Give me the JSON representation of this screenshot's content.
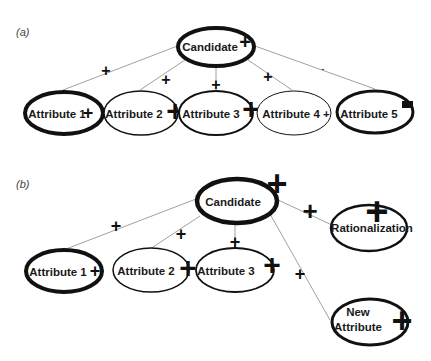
{
  "panels": [
    {
      "label": "(a)",
      "root": {
        "label": "Candidate",
        "sign": "+"
      },
      "children": [
        {
          "label": "Attribute 1",
          "node_sign": "+",
          "edge_sign": "+"
        },
        {
          "label": "Attribute 2",
          "node_sign": "+",
          "edge_sign": "+"
        },
        {
          "label": "Attribute 3",
          "node_sign": "+",
          "edge_sign": "+"
        },
        {
          "label": "Attribute 4 +",
          "node_sign": "",
          "edge_sign": "+"
        },
        {
          "label": "Attribute 5",
          "node_sign": "-",
          "edge_sign": "-"
        }
      ]
    },
    {
      "label": "(b)",
      "root": {
        "label": "Candidate",
        "sign": "+"
      },
      "children": [
        {
          "label": "Attribute 1",
          "node_sign": "+",
          "edge_sign": "+"
        },
        {
          "label": "Attribute 2",
          "node_sign": "+",
          "edge_sign": "+"
        },
        {
          "label": "Attribute 3",
          "node_sign": "+",
          "edge_sign": "+"
        },
        {
          "label": "Rationalization",
          "node_sign": "+",
          "edge_sign": "+"
        },
        {
          "label_line1": "New",
          "label_line2": "Attribute",
          "node_sign": "+",
          "edge_sign": "+"
        }
      ]
    }
  ]
}
